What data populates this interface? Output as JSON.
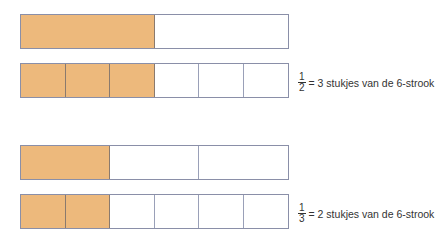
{
  "colors": {
    "filled": "#edb97c",
    "border": "#8a8fa8",
    "empty": "#ffffff"
  },
  "groups": [
    {
      "fraction_strip": {
        "parts": 2,
        "filled": 1
      },
      "six_strip": {
        "parts": 6,
        "filled": 3
      },
      "label": {
        "numerator": "1",
        "denominator": "2",
        "text": "= 3 stukjes van de 6-strook"
      }
    },
    {
      "fraction_strip": {
        "parts": 3,
        "filled": 1
      },
      "six_strip": {
        "parts": 6,
        "filled": 2
      },
      "label": {
        "numerator": "1",
        "denominator": "3",
        "text": "= 2 stukjes van de 6-strook"
      }
    }
  ]
}
